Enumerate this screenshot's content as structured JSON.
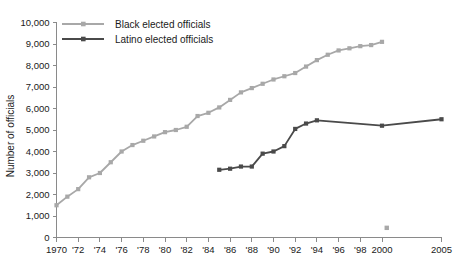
{
  "chart_data": {
    "type": "line",
    "title": "",
    "xlabel": "",
    "ylabel": "Number of officials",
    "ylim": [
      0,
      10000
    ],
    "ytick_values": [
      0,
      1000,
      2000,
      3000,
      4000,
      5000,
      6000,
      7000,
      8000,
      9000,
      10000
    ],
    "ytick_labels": [
      "0",
      "1,000",
      "2,000",
      "3,000",
      "4,000",
      "5,000",
      "6,000",
      "7,000",
      "8,000",
      "9,000",
      "10,000"
    ],
    "xlim": [
      1970,
      2005
    ],
    "xtick_values": [
      1970,
      1972,
      1974,
      1976,
      1978,
      1980,
      1982,
      1984,
      1986,
      1988,
      1990,
      1992,
      1994,
      1996,
      1998,
      2000,
      2005
    ],
    "xtick_labels": [
      "1970",
      "'72",
      "'74",
      "'76",
      "'78",
      "'80",
      "'82",
      "'84",
      "'86",
      "'88",
      "'90",
      "'92",
      "'94",
      "'96",
      "'98",
      "2000",
      "2005"
    ],
    "grid": false,
    "legend_position": "top-left",
    "series": [
      {
        "name": "Black elected officials",
        "color": "#a8a8a8",
        "marker": "square",
        "x": [
          1970,
          1971,
          1972,
          1973,
          1974,
          1975,
          1976,
          1977,
          1978,
          1979,
          1980,
          1981,
          1982,
          1983,
          1984,
          1985,
          1986,
          1987,
          1988,
          1989,
          1990,
          1991,
          1992,
          1993,
          1994,
          1995,
          1996,
          1997,
          1998,
          1999,
          2000
        ],
        "values": [
          1500,
          1900,
          2250,
          2800,
          3000,
          3500,
          4000,
          4300,
          4500,
          4700,
          4900,
          5000,
          5150,
          5650,
          5800,
          6050,
          6400,
          6750,
          6950,
          7150,
          7350,
          7500,
          7650,
          7950,
          8250,
          8500,
          8700,
          8800,
          8900,
          8950,
          9100
        ]
      },
      {
        "name": "Latino elected officials",
        "color": "#4a4a4a",
        "marker": "square",
        "x": [
          1985,
          1986,
          1987,
          1988,
          1989,
          1990,
          1991,
          1992,
          1993,
          1994,
          2000,
          2005
        ],
        "values": [
          3150,
          3200,
          3300,
          3300,
          3900,
          4000,
          4250,
          5050,
          5300,
          5450,
          5200,
          5500
        ]
      }
    ],
    "stray_marker": {
      "x": 2000.4,
      "value": 450,
      "color": "#a8a8a8"
    }
  },
  "legend": {
    "items": [
      {
        "label": "Black elected officials",
        "color": "#a8a8a8"
      },
      {
        "label": "Latino elected officials",
        "color": "#4a4a4a"
      }
    ]
  }
}
